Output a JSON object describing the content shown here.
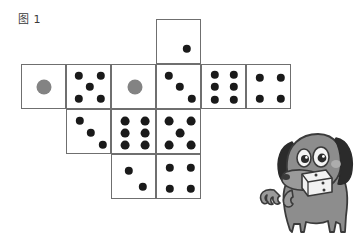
{
  "figure": {
    "caption": "图 1",
    "background_color": "#ffffff",
    "line_color": "#6f6f6f",
    "pip_color": "#1a1a1a",
    "pip_gray_color": "#838383"
  },
  "dice_net": {
    "description": "Cross-shaped unfolded net of dice faces drawn as a grid of squares with pips",
    "cell_size": 45,
    "cells": [
      {
        "id": "cell-top",
        "name": "die-face-two-top",
        "value": 2,
        "col": 3,
        "row": 0,
        "x": 156,
        "y": 19,
        "pip_style": "diagonal",
        "pips": [
          {
            "cx": 30,
            "cy": 29,
            "r": 4.2,
            "color": "dark"
          },
          {
            "cx": 57,
            "cy": 55,
            "r": 4.2,
            "color": "dark"
          }
        ]
      },
      {
        "id": "cell-r1c1",
        "name": "die-face-one-gray-left",
        "value": 1,
        "col": 0,
        "row": 1,
        "x": 21,
        "y": 64,
        "pip_style": "center-gray",
        "pips": [
          {
            "cx": 22,
            "cy": 22,
            "r": 7.5,
            "color": "gray"
          }
        ]
      },
      {
        "id": "cell-r1c2",
        "name": "die-face-five",
        "value": 5,
        "col": 1,
        "row": 1,
        "x": 66,
        "y": 64,
        "pip_style": "quincunx",
        "pips": [
          {
            "cx": 12,
            "cy": 11,
            "r": 4.2,
            "color": "dark"
          },
          {
            "cx": 34,
            "cy": 11,
            "r": 4.2,
            "color": "dark"
          },
          {
            "cx": 23,
            "cy": 22,
            "r": 4.2,
            "color": "dark"
          },
          {
            "cx": 12,
            "cy": 34,
            "r": 4.2,
            "color": "dark"
          },
          {
            "cx": 34,
            "cy": 34,
            "r": 4.2,
            "color": "dark"
          }
        ]
      },
      {
        "id": "cell-r1c3",
        "name": "die-face-one-gray-middle",
        "value": 1,
        "col": 2,
        "row": 1,
        "x": 111,
        "y": 64,
        "pip_style": "center-gray",
        "pips": [
          {
            "cx": 23,
            "cy": 22,
            "r": 7.5,
            "color": "gray"
          }
        ]
      },
      {
        "id": "cell-r1c4",
        "name": "die-face-three-upper",
        "value": 3,
        "col": 3,
        "row": 1,
        "x": 156,
        "y": 64,
        "pip_style": "diagonal",
        "pips": [
          {
            "cx": 12,
            "cy": 11,
            "r": 4.2,
            "color": "dark"
          },
          {
            "cx": 23,
            "cy": 22,
            "r": 4.2,
            "color": "dark"
          },
          {
            "cx": 35,
            "cy": 34,
            "r": 4.2,
            "color": "dark"
          }
        ]
      },
      {
        "id": "cell-r1c5",
        "name": "die-face-six-right",
        "value": 6,
        "col": 4,
        "row": 1,
        "x": 201,
        "y": 64,
        "pip_style": "two-columns-of-three",
        "pips": [
          {
            "cx": 13,
            "cy": 10,
            "r": 4.2,
            "color": "dark"
          },
          {
            "cx": 32,
            "cy": 10,
            "r": 4.2,
            "color": "dark"
          },
          {
            "cx": 13,
            "cy": 22,
            "r": 4.2,
            "color": "dark"
          },
          {
            "cx": 32,
            "cy": 22,
            "r": 4.2,
            "color": "dark"
          },
          {
            "cx": 13,
            "cy": 35,
            "r": 4.2,
            "color": "dark"
          },
          {
            "cx": 32,
            "cy": 35,
            "r": 4.2,
            "color": "dark"
          }
        ]
      },
      {
        "id": "cell-r1c6",
        "name": "die-face-four-far-right",
        "value": 4,
        "col": 5,
        "row": 1,
        "x": 246,
        "y": 64,
        "pip_style": "corners",
        "pips": [
          {
            "cx": 13,
            "cy": 13,
            "r": 4.2,
            "color": "dark"
          },
          {
            "cx": 34,
            "cy": 13,
            "r": 4.2,
            "color": "dark"
          },
          {
            "cx": 13,
            "cy": 34,
            "r": 4.2,
            "color": "dark"
          },
          {
            "cx": 34,
            "cy": 34,
            "r": 4.2,
            "color": "dark"
          }
        ]
      },
      {
        "id": "cell-r2c2",
        "name": "die-face-three-lower",
        "value": 3,
        "col": 1,
        "row": 2,
        "x": 66,
        "y": 109,
        "pip_style": "diagonal",
        "pips": [
          {
            "cx": 13,
            "cy": 11,
            "r": 4.2,
            "color": "dark"
          },
          {
            "cx": 24,
            "cy": 23,
            "r": 4.2,
            "color": "dark"
          },
          {
            "cx": 36,
            "cy": 35,
            "r": 4.2,
            "color": "dark"
          }
        ]
      },
      {
        "id": "cell-r2c3",
        "name": "die-face-six-middle",
        "value": 6,
        "col": 2,
        "row": 2,
        "x": 111,
        "y": 109,
        "pip_style": "two-columns-of-three",
        "pips": [
          {
            "cx": 13,
            "cy": 11,
            "r": 4.4,
            "color": "dark"
          },
          {
            "cx": 33,
            "cy": 11,
            "r": 4.4,
            "color": "dark"
          },
          {
            "cx": 13,
            "cy": 23,
            "r": 4.4,
            "color": "dark"
          },
          {
            "cx": 33,
            "cy": 23,
            "r": 4.4,
            "color": "dark"
          },
          {
            "cx": 13,
            "cy": 35,
            "r": 4.4,
            "color": "dark"
          },
          {
            "cx": 33,
            "cy": 35,
            "r": 4.4,
            "color": "dark"
          }
        ]
      },
      {
        "id": "cell-r2c4",
        "name": "die-face-five-middle",
        "value": 5,
        "col": 3,
        "row": 2,
        "x": 156,
        "y": 109,
        "pip_style": "quincunx",
        "pips": [
          {
            "cx": 12,
            "cy": 11,
            "r": 4.4,
            "color": "dark"
          },
          {
            "cx": 34,
            "cy": 11,
            "r": 4.4,
            "color": "dark"
          },
          {
            "cx": 23,
            "cy": 23,
            "r": 4.4,
            "color": "dark"
          },
          {
            "cx": 12,
            "cy": 35,
            "r": 4.4,
            "color": "dark"
          },
          {
            "cx": 34,
            "cy": 35,
            "r": 4.4,
            "color": "dark"
          }
        ]
      },
      {
        "id": "cell-r3c3",
        "name": "die-face-two-bottom",
        "value": 2,
        "col": 2,
        "row": 3,
        "x": 111,
        "y": 154,
        "pip_style": "diagonal",
        "pips": [
          {
            "cx": 17,
            "cy": 16,
            "r": 4.2,
            "color": "dark"
          },
          {
            "cx": 31,
            "cy": 32,
            "r": 4.2,
            "color": "dark"
          }
        ]
      },
      {
        "id": "cell-r3c4",
        "name": "die-face-four-bottom",
        "value": 4,
        "col": 3,
        "row": 3,
        "x": 156,
        "y": 154,
        "pip_style": "corners",
        "pips": [
          {
            "cx": 13,
            "cy": 13,
            "r": 4.2,
            "color": "dark"
          },
          {
            "cx": 34,
            "cy": 13,
            "r": 4.2,
            "color": "dark"
          },
          {
            "cx": 13,
            "cy": 34,
            "r": 4.2,
            "color": "dark"
          },
          {
            "cx": 34,
            "cy": 34,
            "r": 4.2,
            "color": "dark"
          }
        ]
      }
    ]
  },
  "dog": {
    "name": "cartoon-dog-holding-die",
    "body_color": "#8d8d8d",
    "ear_color": "#2b2b2b",
    "outline_color": "#3a3a3a",
    "die_color": "#f2f2f2",
    "held_item": "die"
  }
}
